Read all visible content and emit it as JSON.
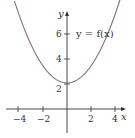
{
  "chart_data": {
    "type": "line",
    "title": "",
    "xlabel": "x",
    "ylabel": "y",
    "xlim": [
      -4.5,
      4.8
    ],
    "ylim": [
      -2.0,
      9.0
    ],
    "x_ticks": [
      -4,
      -2,
      2,
      4
    ],
    "x_tick_labels": [
      "−4",
      "−2",
      "2",
      "4"
    ],
    "y_ticks": [
      2,
      4,
      6
    ],
    "y_tick_labels": [
      "2",
      "4",
      "6"
    ],
    "grid": false,
    "legend": [],
    "annotations": [
      {
        "text": "y = f(x)",
        "x": 0.6,
        "y": 6
      }
    ],
    "series": [
      {
        "name": "y = f(x)",
        "description": "upward-opening parabola-like curve, minimum about 2.1 at x = 0",
        "color": "#8a7070",
        "x": [
          -4.3,
          -4,
          -3,
          -2,
          -1,
          0,
          1,
          2,
          3,
          4,
          4.7
        ],
        "y": [
          8.6,
          7.7,
          5.3,
          3.5,
          2.45,
          2.1,
          2.45,
          3.5,
          5.3,
          7.7,
          9.8
        ]
      }
    ]
  },
  "labels": {
    "x_axis": "x",
    "y_axis": "y",
    "curve": "y = f(x)",
    "xt0": "−4",
    "xt1": "−2",
    "xt2": "2",
    "xt3": "4",
    "yt0": "2",
    "yt1": "4",
    "yt2": "6"
  }
}
